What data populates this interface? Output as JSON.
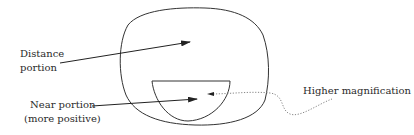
{
  "diagram": {
    "type": "bifocal-lens-schematic",
    "labels": {
      "distance": [
        "Distance",
        "portion"
      ],
      "near": [
        "Near portion",
        "(more positive)"
      ],
      "magnification": "Higher magnification"
    },
    "shapes": {
      "outer_lens": "Distance portion outline (rounded lens shape)",
      "segment": "Near portion segment (D-shaped, flat top)"
    },
    "colors": {
      "line": "#333333",
      "text": "#2a2a2a",
      "dotted": "#777777",
      "background": "#ffffff"
    }
  }
}
